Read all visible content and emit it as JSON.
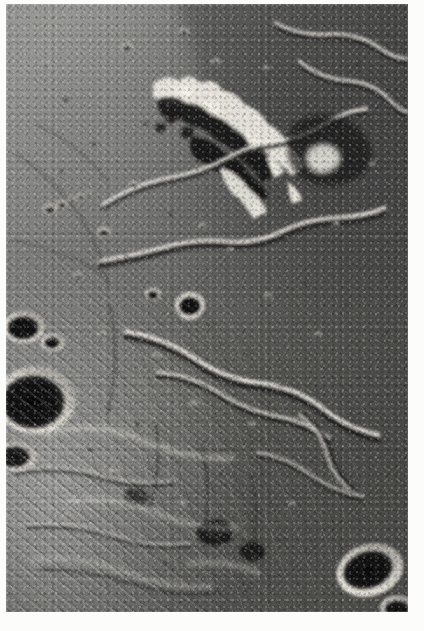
{
  "page": {
    "background_color": "#fcfcfb",
    "margin_color": "#ffffff",
    "width": 424,
    "height": 631
  },
  "photograph": {
    "kind": "lunar-surface-photograph",
    "palette": "grayscale",
    "caption": "",
    "frame": {
      "left": 6,
      "top": 4,
      "width": 402,
      "height": 608
    },
    "tone": {
      "darkest": "#141414",
      "shadow": "#2b2b2b",
      "midtone": "#767674",
      "highlight": "#d9d7d2",
      "brightest": "#f2f0ea"
    },
    "illumination": {
      "sun_from": "lower-left",
      "shadow_direction": "upper-right"
    },
    "terrain_regions": [
      {
        "name": "smooth-mare-plain",
        "position": "upper-left"
      },
      {
        "name": "cratered-mare-plain",
        "position": "center"
      },
      {
        "name": "hummocky-ejecta-terrain",
        "position": "lower-left"
      },
      {
        "name": "fractured-polygonal-terrain",
        "position": "lower-center"
      },
      {
        "name": "shadowed-highland-massif",
        "position": "upper-center"
      },
      {
        "name": "scarp-bounded-upland",
        "position": "right"
      }
    ],
    "features": [
      {
        "name": "bright-ridge-massif",
        "type": "massif",
        "cx": 236,
        "cy": 140
      },
      {
        "name": "bowl-crater-central",
        "type": "crater",
        "cx": 190,
        "cy": 305,
        "r": 12
      },
      {
        "name": "shadowed-crater-left-upper",
        "type": "crater",
        "cx": 24,
        "cy": 327,
        "r": 16
      },
      {
        "name": "shadowed-crater-left-lower",
        "type": "crater",
        "cx": 36,
        "cy": 395,
        "r": 30
      },
      {
        "name": "shadowed-crater-bottom-right",
        "type": "crater",
        "cx": 372,
        "cy": 572,
        "r": 22
      },
      {
        "name": "sinuous-rille-upper",
        "type": "rille"
      },
      {
        "name": "sinuous-rille-central",
        "type": "rille"
      },
      {
        "name": "wrinkle-ridge-lower",
        "type": "wrinkle-ridge"
      },
      {
        "name": "crater-chain",
        "type": "crater-chain",
        "cx": 52,
        "cy": 200
      }
    ]
  }
}
